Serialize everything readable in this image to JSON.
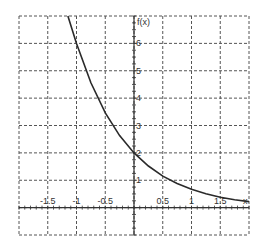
{
  "chart_data": {
    "type": "line",
    "title": "",
    "xlabel": "x",
    "ylabel": "f(x)",
    "xlim": [
      -2,
      2
    ],
    "ylim": [
      -1,
      7
    ],
    "grid": true,
    "grid_style": "dashed",
    "x_ticks": [
      "-1.5",
      "-1",
      "-0.5",
      "0.5",
      "1",
      "1.5"
    ],
    "x_tick_values": [
      -1.5,
      -1,
      -0.5,
      0.5,
      1,
      1.5
    ],
    "y_ticks": [
      "1",
      "2",
      "3",
      "4",
      "5",
      "6"
    ],
    "y_tick_values": [
      1,
      2,
      3,
      4,
      5,
      6
    ],
    "series": [
      {
        "name": "f(x)",
        "x": [
          -1.15,
          -1,
          -0.75,
          -0.5,
          -0.25,
          0,
          0.25,
          0.5,
          0.75,
          1,
          1.25,
          1.5,
          1.75,
          2
        ],
        "values": [
          7.0,
          6.0,
          4.56,
          3.46,
          2.63,
          2.0,
          1.52,
          1.15,
          0.88,
          0.67,
          0.51,
          0.38,
          0.29,
          0.22
        ]
      }
    ]
  },
  "labels": {
    "y_axis": "f(x)",
    "x_axis": "x"
  },
  "colors": {
    "curve": "#2a2a2a",
    "grid": "#555555",
    "axis": "#333333"
  }
}
